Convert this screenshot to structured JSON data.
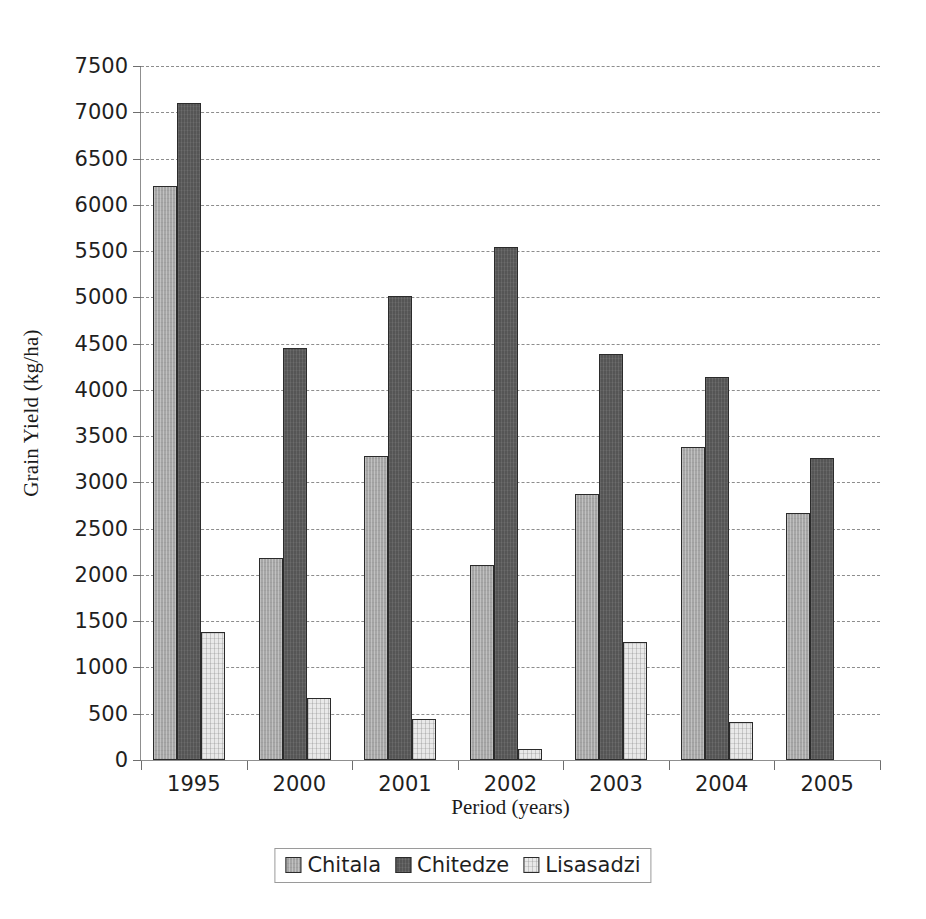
{
  "chart_data": {
    "type": "bar",
    "title": "",
    "xlabel": "Period (years)",
    "ylabel": "Grain Yield (kg/ha)",
    "categories": [
      "1995",
      "2000",
      "2001",
      "2002",
      "2003",
      "2004",
      "2005"
    ],
    "series": [
      {
        "name": "Chitala",
        "color": "#a6a6a6",
        "values": [
          6200,
          2180,
          3290,
          2110,
          2870,
          3380,
          2670
        ]
      },
      {
        "name": "Chitedze",
        "color": "#555555",
        "values": [
          7100,
          4450,
          5010,
          5540,
          4390,
          4140,
          3260
        ]
      },
      {
        "name": "Lisasadzi",
        "color": "#e9e9e9",
        "values": [
          1380,
          670,
          440,
          120,
          1270,
          410,
          null
        ]
      }
    ],
    "ylim": [
      0,
      7500
    ],
    "ytick_step": 500,
    "yticks": [
      0,
      500,
      1000,
      1500,
      2000,
      2500,
      3000,
      3500,
      4000,
      4500,
      5000,
      5500,
      6000,
      6500,
      7000,
      7500
    ],
    "ytick_labels": [
      "0",
      "500",
      "1000",
      "1500",
      "2000",
      "2500",
      "3000",
      "3500",
      "4000",
      "4500",
      "5000",
      "5500",
      "6000",
      "6500",
      "7000",
      "7500"
    ],
    "grid": true,
    "grid_style": "dashed",
    "grid_axis": "y",
    "legend_position": "bottom-center",
    "bar_style": "grouped"
  }
}
